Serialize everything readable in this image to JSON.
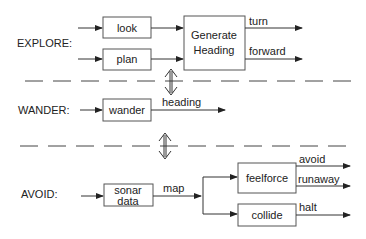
{
  "layers": {
    "explore": {
      "label": "EXPLORE:",
      "modules": [
        "look",
        "plan"
      ],
      "combiner": [
        "Generate",
        "Heading"
      ],
      "outputs": [
        "turn",
        "forward"
      ]
    },
    "wander": {
      "label": "WANDER:",
      "module": "wander",
      "output": "heading"
    },
    "avoid": {
      "label": "AVOID:",
      "input_module": [
        "sonar",
        "data"
      ],
      "link": "map",
      "modules": [
        "feelforce",
        "collide"
      ],
      "outputs": [
        "avoid",
        "runaway",
        "halt"
      ]
    }
  },
  "icons": {
    "layer_link": "double-headed-arrow"
  }
}
